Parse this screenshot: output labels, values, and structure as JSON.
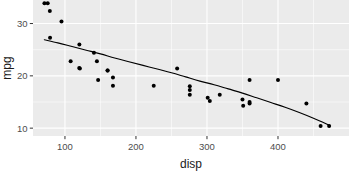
{
  "chart_data": {
    "type": "scatter",
    "title": "",
    "subtitle": "",
    "xlabel": "disp",
    "ylabel": "mpg",
    "xlim": [
      55,
      500
    ],
    "ylim": [
      8.5,
      34.5
    ],
    "xticks": [
      100,
      200,
      300,
      400
    ],
    "xtick_labels": [
      "100",
      "200",
      "300",
      "400"
    ],
    "yticks": [
      10,
      20,
      30
    ],
    "ytick_labels": [
      "10",
      "20",
      "30"
    ],
    "xminor": [
      50,
      150,
      250,
      350,
      450
    ],
    "yminor": [
      15,
      25
    ],
    "grid": true,
    "legend": "none",
    "point_color": "#000000",
    "line_color": "#000000",
    "panel_color": "#ebebeb",
    "grid_color": "#ffffff",
    "points": [
      {
        "x": 71.1,
        "y": 33.9
      },
      {
        "x": 75.7,
        "y": 33.9
      },
      {
        "x": 78.7,
        "y": 32.4
      },
      {
        "x": 79.0,
        "y": 27.3
      },
      {
        "x": 95.1,
        "y": 30.4
      },
      {
        "x": 108.0,
        "y": 22.8
      },
      {
        "x": 120.1,
        "y": 21.5
      },
      {
        "x": 120.3,
        "y": 26.0
      },
      {
        "x": 121.0,
        "y": 21.4
      },
      {
        "x": 140.8,
        "y": 24.4
      },
      {
        "x": 145.0,
        "y": 22.8
      },
      {
        "x": 146.7,
        "y": 19.2
      },
      {
        "x": 160.0,
        "y": 21.0
      },
      {
        "x": 160.0,
        "y": 21.0
      },
      {
        "x": 167.6,
        "y": 18.1
      },
      {
        "x": 167.6,
        "y": 19.7
      },
      {
        "x": 225.0,
        "y": 18.1
      },
      {
        "x": 258.0,
        "y": 21.4
      },
      {
        "x": 275.8,
        "y": 17.3
      },
      {
        "x": 275.8,
        "y": 16.4
      },
      {
        "x": 275.8,
        "y": 18.0
      },
      {
        "x": 301.0,
        "y": 15.8
      },
      {
        "x": 304.0,
        "y": 15.2
      },
      {
        "x": 318.0,
        "y": 16.4
      },
      {
        "x": 350.0,
        "y": 15.5
      },
      {
        "x": 351.0,
        "y": 14.3
      },
      {
        "x": 360.0,
        "y": 19.2
      },
      {
        "x": 360.0,
        "y": 14.7
      },
      {
        "x": 360.0,
        "y": 15.0
      },
      {
        "x": 400.0,
        "y": 19.2
      },
      {
        "x": 440.0,
        "y": 14.7
      },
      {
        "x": 460.0,
        "y": 10.4
      },
      {
        "x": 472.0,
        "y": 10.4
      }
    ],
    "smooth_curve": [
      {
        "x": 71,
        "y": 26.9
      },
      {
        "x": 90,
        "y": 26.3
      },
      {
        "x": 110,
        "y": 25.6
      },
      {
        "x": 130,
        "y": 24.9
      },
      {
        "x": 150,
        "y": 24.2
      },
      {
        "x": 170,
        "y": 23.4
      },
      {
        "x": 190,
        "y": 22.7
      },
      {
        "x": 210,
        "y": 22.0
      },
      {
        "x": 230,
        "y": 21.3
      },
      {
        "x": 250,
        "y": 20.6
      },
      {
        "x": 270,
        "y": 19.8
      },
      {
        "x": 290,
        "y": 19.0
      },
      {
        "x": 310,
        "y": 18.3
      },
      {
        "x": 330,
        "y": 17.5
      },
      {
        "x": 350,
        "y": 16.7
      },
      {
        "x": 370,
        "y": 15.8
      },
      {
        "x": 390,
        "y": 14.9
      },
      {
        "x": 410,
        "y": 14.0
      },
      {
        "x": 430,
        "y": 13.0
      },
      {
        "x": 450,
        "y": 11.9
      },
      {
        "x": 472,
        "y": 10.6
      }
    ]
  }
}
